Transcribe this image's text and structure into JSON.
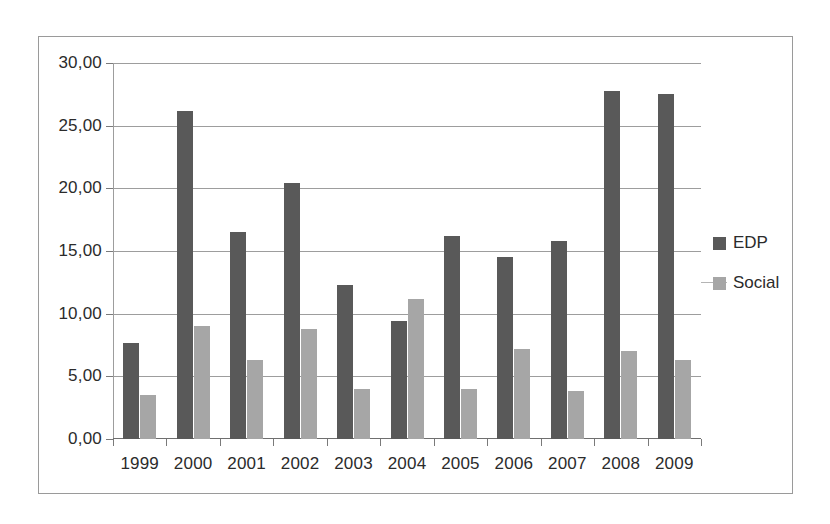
{
  "chart_data": {
    "type": "bar",
    "title": "",
    "xlabel": "",
    "ylabel": "",
    "categories": [
      "1999",
      "2000",
      "2001",
      "2002",
      "2003",
      "2004",
      "2005",
      "2006",
      "2007",
      "2008",
      "2009"
    ],
    "series": [
      {
        "name": "EDP",
        "color": "#595959",
        "values": [
          7.7,
          26.2,
          16.5,
          20.4,
          12.3,
          9.4,
          16.2,
          14.5,
          15.8,
          27.8,
          27.5
        ]
      },
      {
        "name": "Social",
        "color": "#a6a6a6",
        "values": [
          3.5,
          9.0,
          6.3,
          8.8,
          4.0,
          11.2,
          4.0,
          7.2,
          3.8,
          7.0,
          6.3
        ]
      }
    ],
    "ylim": [
      0,
      30
    ],
    "ytick_values": [
      0,
      5,
      10,
      15,
      20,
      25,
      30
    ],
    "ytick_labels": [
      "0,00",
      "5,00",
      "10,00",
      "15,00",
      "20,00",
      "25,00",
      "30,00"
    ],
    "grid": "horizontal",
    "legend_position": "right",
    "legend": [
      "EDP",
      "Social"
    ]
  }
}
